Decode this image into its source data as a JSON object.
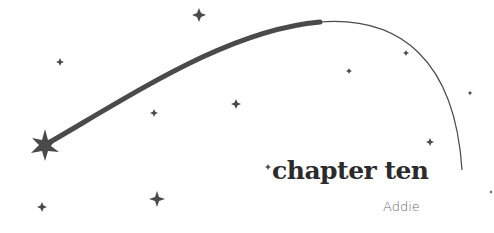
{
  "header": {
    "title": "chapter ten",
    "author": "Addie"
  },
  "decoration": {
    "ink_color": "#4a4a4a",
    "background": "#ffffff",
    "icons": [
      "shooting-star-icon",
      "star-icon",
      "sparkle-icon"
    ]
  }
}
